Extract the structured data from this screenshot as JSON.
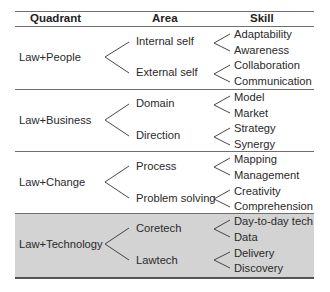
{
  "header": {
    "quadrant": "Quadrant",
    "area": "Area",
    "skill": "Skill"
  },
  "rows": [
    {
      "quadrant": "Law+People",
      "shaded": false,
      "areas": [
        {
          "label": "Internal self",
          "skills": [
            "Adaptability",
            "Awareness"
          ]
        },
        {
          "label": "External self",
          "skills": [
            "Collaboration",
            "Communication"
          ]
        }
      ]
    },
    {
      "quadrant": "Law+Business",
      "shaded": false,
      "areas": [
        {
          "label": "Domain",
          "skills": [
            "Model",
            "Market"
          ]
        },
        {
          "label": "Direction",
          "skills": [
            "Strategy",
            "Synergy"
          ]
        }
      ]
    },
    {
      "quadrant": "Law+Change",
      "shaded": false,
      "areas": [
        {
          "label": "Process",
          "skills": [
            "Mapping",
            "Management"
          ]
        },
        {
          "label": "Problem solving",
          "skills": [
            "Creativity",
            "Comprehension"
          ]
        }
      ]
    },
    {
      "quadrant": "Law+Technology",
      "shaded": true,
      "areas": [
        {
          "label": "Coretech",
          "skills": [
            "Day-to-day tech",
            "Data"
          ]
        },
        {
          "label": "Lawtech",
          "skills": [
            "Delivery",
            "Discovery"
          ]
        }
      ]
    }
  ],
  "colors": {
    "shade": "#d3d3d3",
    "rule": "#6f6f6f",
    "text": "#2a2a2a"
  }
}
